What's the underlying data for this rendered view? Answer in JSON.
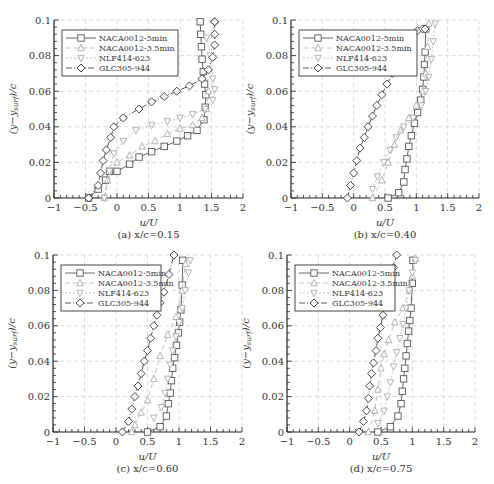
{
  "legend": [
    "NACA0012-5min",
    "NACA0012-3.5min",
    "NLF414-623",
    "GLC305-944"
  ],
  "chart_data": [
    {
      "type": "line",
      "panel": "a",
      "caption": "(a) x/c=0.15",
      "xlabel": "u/U",
      "ylabel": "(y−y_surf)/c",
      "xlim": [
        -1,
        2
      ],
      "ylim": [
        0,
        0.1
      ],
      "xticks": [
        "-1",
        "-0.5",
        "0",
        "0.5",
        "1",
        "1.5",
        "2"
      ],
      "yticks": [
        "0",
        "0.02",
        "0.04",
        "0.06",
        "0.08",
        "0.1"
      ],
      "grid": true,
      "legend_position": "upper-left",
      "series": [
        {
          "name": "NACA0012-5min",
          "x": [
            -0.45,
            -0.3,
            -0.18,
            -0.12,
            0.0,
            0.2,
            0.35,
            0.55,
            0.75,
            0.95,
            1.12,
            1.27,
            1.38,
            1.4,
            1.41,
            1.39,
            1.37,
            1.35,
            1.34,
            1.33,
            1.32
          ],
          "y": [
            0.0,
            0.005,
            0.01,
            0.015,
            0.015,
            0.019,
            0.023,
            0.026,
            0.029,
            0.032,
            0.035,
            0.038,
            0.044,
            0.051,
            0.058,
            0.064,
            0.071,
            0.078,
            0.085,
            0.092,
            0.099
          ]
        },
        {
          "name": "NACA0012-3.5min",
          "x": [
            -0.2,
            -0.15,
            0.0,
            0.2,
            0.4,
            0.6,
            0.8,
            1.0,
            1.2,
            1.35,
            1.42,
            1.45
          ],
          "y": [
            0.0,
            0.01,
            0.02,
            0.024,
            0.029,
            0.032,
            0.036,
            0.039,
            0.041,
            0.045,
            0.05,
            0.06
          ]
        },
        {
          "name": "NLF414-623",
          "x": [
            -0.2,
            -0.12,
            -0.05,
            0.1,
            0.3,
            0.55,
            0.8,
            1.0,
            1.2,
            1.4,
            1.52,
            1.55,
            1.52,
            1.48,
            1.42
          ],
          "y": [
            0.0,
            0.015,
            0.025,
            0.032,
            0.038,
            0.041,
            0.043,
            0.045,
            0.047,
            0.05,
            0.055,
            0.061,
            0.067,
            0.08,
            0.09
          ]
        },
        {
          "name": "GLC305-944",
          "x": [
            -0.45,
            -0.3,
            -0.26,
            -0.22,
            -0.17,
            -0.1,
            -0.05,
            0.1,
            0.35,
            0.55,
            0.75,
            0.95,
            1.15,
            1.35,
            1.45,
            1.52,
            1.55,
            1.55,
            1.55,
            1.55
          ],
          "y": [
            0.0,
            0.007,
            0.014,
            0.021,
            0.027,
            0.034,
            0.04,
            0.045,
            0.05,
            0.054,
            0.057,
            0.06,
            0.063,
            0.067,
            0.072,
            0.079,
            0.086,
            0.092,
            0.099,
            0.099
          ]
        }
      ]
    },
    {
      "type": "line",
      "panel": "b",
      "caption": "(b) x/c=0.40",
      "xlabel": "u/U",
      "ylabel": "(y−y_surf)/c",
      "xlim": [
        -1,
        2
      ],
      "ylim": [
        0,
        0.1
      ],
      "xticks": [
        "-1",
        "-0.5",
        "0",
        "0.5",
        "1",
        "1.5",
        "2"
      ],
      "yticks": [
        "0",
        "0.02",
        "0.04",
        "0.06",
        "0.08",
        "0.1"
      ],
      "grid": true,
      "legend_position": "upper-left",
      "series": [
        {
          "name": "NACA0012-5min",
          "x": [
            0.55,
            0.72,
            0.8,
            0.82,
            0.85,
            0.88,
            0.92,
            0.97,
            1.02,
            1.07,
            1.1,
            1.12,
            1.13,
            1.14,
            1.15
          ],
          "y": [
            0.0,
            0.003,
            0.009,
            0.016,
            0.022,
            0.029,
            0.035,
            0.042,
            0.048,
            0.055,
            0.061,
            0.068,
            0.075,
            0.082,
            0.095
          ]
        },
        {
          "name": "NACA0012-3.5min",
          "x": [
            0.3,
            0.45,
            0.55,
            0.65,
            0.75,
            0.88,
            1.0,
            1.1,
            1.15,
            1.18,
            1.2
          ],
          "y": [
            0.0,
            0.01,
            0.02,
            0.03,
            0.038,
            0.045,
            0.052,
            0.06,
            0.07,
            0.085,
            0.098
          ]
        },
        {
          "name": "NLF414-623",
          "x": [
            0.3,
            0.38,
            0.48,
            0.58,
            0.68,
            0.8,
            0.95,
            1.08,
            1.15,
            1.2,
            1.24,
            1.27,
            1.3
          ],
          "y": [
            0.005,
            0.012,
            0.02,
            0.027,
            0.034,
            0.04,
            0.045,
            0.052,
            0.06,
            0.068,
            0.078,
            0.088,
            0.098
          ]
        },
        {
          "name": "GLC305-944",
          "x": [
            -0.1,
            -0.05,
            0.0,
            0.05,
            0.1,
            0.17,
            0.23,
            0.3,
            0.37,
            0.45,
            0.53,
            0.62,
            0.72,
            0.82,
            0.92,
            1.02,
            1.1,
            1.14
          ],
          "y": [
            0.0,
            0.007,
            0.014,
            0.021,
            0.028,
            0.034,
            0.04,
            0.046,
            0.052,
            0.058,
            0.064,
            0.07,
            0.076,
            0.083,
            0.089,
            0.094,
            0.095,
            0.095
          ]
        }
      ]
    },
    {
      "type": "line",
      "panel": "c",
      "caption": "(c) x/c=0.60",
      "xlabel": "u/U",
      "ylabel": "(y−y_surf)/c",
      "xlim": [
        -1,
        2
      ],
      "ylim": [
        0,
        0.1
      ],
      "xticks": [
        "-1",
        "-0.5",
        "0",
        "0.5",
        "1",
        "1.5",
        "2"
      ],
      "yticks": [
        "0",
        "0.02",
        "0.04",
        "0.06",
        "0.08",
        "0.1"
      ],
      "grid": true,
      "legend_position": "upper-left",
      "series": [
        {
          "name": "NACA0012-5min",
          "x": [
            0.5,
            0.7,
            0.8,
            0.83,
            0.86,
            0.88,
            0.9,
            0.93,
            0.96,
            0.99,
            1.01,
            1.03,
            1.05,
            1.06
          ],
          "y": [
            0.0,
            0.003,
            0.009,
            0.016,
            0.022,
            0.029,
            0.036,
            0.042,
            0.049,
            0.056,
            0.062,
            0.069,
            0.083,
            0.097
          ]
        },
        {
          "name": "NACA0012-3.5min",
          "x": [
            0.25,
            0.3,
            0.4,
            0.5,
            0.6,
            0.7,
            0.82,
            0.95,
            1.05,
            1.1
          ],
          "y": [
            0.0,
            0.004,
            0.011,
            0.018,
            0.03,
            0.043,
            0.055,
            0.065,
            0.08,
            0.095
          ]
        },
        {
          "name": "NLF414-623",
          "x": [
            0.6,
            0.72,
            0.78,
            0.82,
            0.86,
            0.9,
            0.95,
            1.0,
            1.05,
            1.1,
            1.15,
            1.18
          ],
          "y": [
            0.008,
            0.014,
            0.022,
            0.03,
            0.038,
            0.046,
            0.054,
            0.062,
            0.07,
            0.08,
            0.09,
            0.097
          ]
        },
        {
          "name": "GLC305-944",
          "x": [
            0.1,
            0.2,
            0.25,
            0.3,
            0.35,
            0.4,
            0.45,
            0.5,
            0.55,
            0.6,
            0.65,
            0.7,
            0.76,
            0.84,
            0.92
          ],
          "y": [
            0.0,
            0.006,
            0.013,
            0.02,
            0.026,
            0.033,
            0.04,
            0.046,
            0.053,
            0.06,
            0.066,
            0.073,
            0.079,
            0.089,
            0.1
          ]
        }
      ]
    },
    {
      "type": "line",
      "panel": "d",
      "caption": "(d) x/c=0.75",
      "xlabel": "u/U",
      "ylabel": "(y−y_surf)/c",
      "xlim": [
        -1,
        2
      ],
      "ylim": [
        0,
        0.1
      ],
      "xticks": [
        "-1",
        "-0.5",
        "0",
        "0.5",
        "1",
        "1.5",
        "2"
      ],
      "yticks": [
        "0",
        "0.02",
        "0.04",
        "0.06",
        "0.08",
        "0.1"
      ],
      "grid": true,
      "legend_position": "upper-left",
      "series": [
        {
          "name": "NACA0012-5min",
          "x": [
            0.45,
            0.65,
            0.77,
            0.82,
            0.84,
            0.86,
            0.88,
            0.9,
            0.92,
            0.94,
            0.96,
            0.98,
            1.0,
            1.01
          ],
          "y": [
            0.0,
            0.003,
            0.009,
            0.016,
            0.023,
            0.03,
            0.036,
            0.043,
            0.05,
            0.057,
            0.063,
            0.07,
            0.084,
            0.097
          ]
        },
        {
          "name": "NACA0012-3.5min",
          "x": [
            0.3,
            0.4,
            0.45,
            0.5,
            0.55,
            0.62,
            0.72,
            0.85,
            0.95,
            1.0,
            1.05
          ],
          "y": [
            0.0,
            0.012,
            0.024,
            0.036,
            0.044,
            0.052,
            0.062,
            0.07,
            0.08,
            0.088,
            0.098
          ]
        },
        {
          "name": "NLF414-623",
          "x": [
            0.45,
            0.55,
            0.6,
            0.65,
            0.7,
            0.75,
            0.8,
            0.85,
            0.9,
            0.95,
            1.0,
            1.05
          ],
          "y": [
            0.005,
            0.012,
            0.02,
            0.028,
            0.037,
            0.045,
            0.053,
            0.061,
            0.07,
            0.08,
            0.09,
            0.097
          ]
        },
        {
          "name": "GLC305-944",
          "x": [
            0.15,
            0.22,
            0.27,
            0.3,
            0.32,
            0.35,
            0.38,
            0.42,
            0.45,
            0.49,
            0.53,
            0.58,
            0.64,
            0.7,
            0.75
          ],
          "y": [
            0.0,
            0.006,
            0.012,
            0.019,
            0.026,
            0.033,
            0.039,
            0.046,
            0.053,
            0.059,
            0.066,
            0.073,
            0.086,
            0.093,
            0.1
          ]
        }
      ]
    }
  ]
}
